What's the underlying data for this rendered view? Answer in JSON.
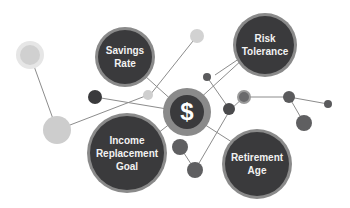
{
  "diagram": {
    "center": {
      "symbol": "$"
    },
    "nodes": [
      {
        "id": "savings-rate",
        "label": "Savings\nRate"
      },
      {
        "id": "risk-tolerance",
        "label": "Risk\nTolerance"
      },
      {
        "id": "income-replacement-goal",
        "label": "Income\nReplacement\nGoal"
      },
      {
        "id": "retirement-age",
        "label": "Retirement\nAge"
      }
    ]
  },
  "colors": {
    "node_fill": "#3a3a3c",
    "node_ring": "#8a8a8a",
    "line": "#8c8c8c",
    "light_node": "#c8c8c8",
    "text": "#f2f2f2"
  }
}
